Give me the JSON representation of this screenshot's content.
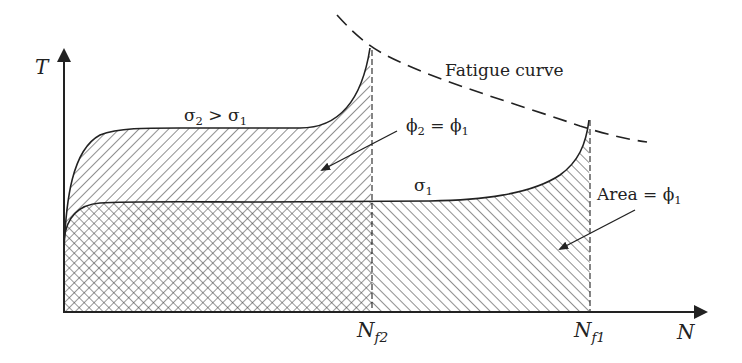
{
  "diagram": {
    "axes": {
      "y_label": "T",
      "x_label": "N"
    },
    "curves": [
      {
        "id": "sigma2",
        "label_main": "σ",
        "label_sub": "2",
        "label_rest": " > σ",
        "label_sub2": "1",
        "description": "higher stress curve, ends at Nf2"
      },
      {
        "id": "sigma1",
        "label_main": "σ",
        "label_sub": "1",
        "description": "lower stress curve, ends at Nf1"
      },
      {
        "id": "fatigue",
        "label": "Fatigue curve",
        "style": "dashed"
      }
    ],
    "markers": [
      {
        "id": "nf2",
        "label_main": "N",
        "label_sub": "f2"
      },
      {
        "id": "nf1",
        "label_main": "N",
        "label_sub": "f1"
      }
    ],
    "annotations": [
      {
        "id": "phi-equal",
        "main": "ϕ",
        "sub": "2",
        "mid": " = ϕ",
        "sub2": "1"
      },
      {
        "id": "area",
        "main": "Area = ϕ",
        "sub": "1"
      }
    ],
    "colors": {
      "ink": "#222222",
      "background": "#ffffff"
    }
  }
}
